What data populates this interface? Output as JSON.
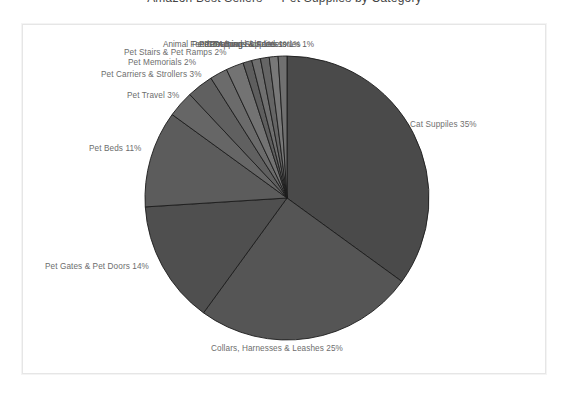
{
  "page": {
    "clipped_title_fragment": "Amazon Best Sellers — Pet Supplies by Category",
    "background_color": "#ffffff",
    "frame_border_color": "#e6e6e6"
  },
  "chart_data": {
    "type": "pie",
    "title": "",
    "subtitle": "",
    "xlabel": "",
    "ylabel": "",
    "legend_position": "none",
    "labels_inline": true,
    "start_angle_deg": 0,
    "direction": "clockwise",
    "categories": [
      "Cat Supplies",
      "Collars, Harnesses & Leashes",
      "Pet Gates & Pet Doors",
      "Pet Beds",
      "Pet Travel",
      "Pet Carriers & Strollers",
      "Pet Memorials",
      "Pet Stairs & Pet Ramps",
      "Animal Feed",
      "Pet Grooming Supplies",
      "Pet Training Aids",
      "Pet Apparel & Accessories",
      "Pet Bowls & Feeders"
    ],
    "values": [
      35,
      25,
      14,
      11,
      3,
      3,
      2,
      2,
      1,
      1,
      1,
      1,
      1
    ],
    "value_unit": "%",
    "slice_colors": [
      "#4a4a4a",
      "#555555",
      "#4f4f4f",
      "#5c5c5c",
      "#666666",
      "#606060",
      "#6b6b6b",
      "#737373",
      "#5e5e5e",
      "#6f6f6f",
      "#656565",
      "#787878",
      "#707070"
    ],
    "data_labels": [
      "Cat Suppiles 35%",
      "Collars, Harnesses & Leashes 25%",
      "Pet Gates & Pet Doors 14%",
      "Pet Beds 11%",
      "Pet Travel 3%",
      "Pet Carriers & Strollers 3%",
      "Pet Memorials 2%",
      "Pet Stairs & Pet Ramps 2%"
    ],
    "overlapped_labels": [
      "Animal Feed 1%",
      "Pet Grooming Supplies 1%",
      "Pet Training Aids 1%",
      "Pet Apparel & Accessories 1%",
      "Pet Bowls & Feeders 1%"
    ]
  },
  "labels": {
    "cat_supplies": "Cat Suppiles 35%",
    "collars": "Collars, Harnesses & Leashes 25%",
    "pet_gates": "Pet Gates & Pet Doors 14%",
    "pet_beds": "Pet Beds 11%",
    "pet_travel": "Pet Travel 3%",
    "pet_carriers": "Pet Carriers & Strollers 3%",
    "pet_memorials": "Pet Memorials 2%",
    "pet_stairs": "Pet Stairs & Pet Ramps 2%",
    "dense_0": "Animal Feed 1%",
    "dense_1": "Pet Grooming Supplies 1%",
    "dense_2": "Pet Training Aids 1%",
    "dense_3": "Pet Apparel & Accessories 1%",
    "dense_4": "Pet Bowls & Feeders 1%"
  }
}
